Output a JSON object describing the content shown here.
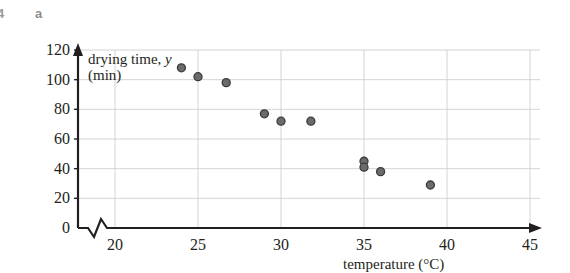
{
  "exercise": {
    "number": "4",
    "part_label": "a"
  },
  "chart_data": {
    "type": "scatter",
    "title": "",
    "xlabel": "temperature (°C)",
    "ylabel_line1": "drying time, ",
    "ylabel_symbol": "y",
    "ylabel_line2": "(min)",
    "xlim": [
      15,
      45
    ],
    "ylim": [
      0,
      120
    ],
    "xticks": [
      20,
      25,
      30,
      35,
      40,
      45
    ],
    "yticks": [
      0,
      20,
      40,
      60,
      80,
      100,
      120
    ],
    "xtick_labels": [
      "20",
      "25",
      "30",
      "35",
      "40",
      "45"
    ],
    "ytick_labels": [
      "0",
      "20",
      "40",
      "60",
      "80",
      "100",
      "120"
    ],
    "grid": true,
    "x_axis_break": true,
    "legend": "none",
    "marker_color": "#6b6b6b",
    "marker_edge_color": "#3a3a3a",
    "grid_color": "#c9c9c9",
    "axis_color": "#231f20",
    "points": [
      {
        "x": 24.0,
        "y": 108
      },
      {
        "x": 25.0,
        "y": 102
      },
      {
        "x": 26.7,
        "y": 98
      },
      {
        "x": 29.0,
        "y": 77
      },
      {
        "x": 30.0,
        "y": 72
      },
      {
        "x": 31.8,
        "y": 72
      },
      {
        "x": 35.0,
        "y": 45
      },
      {
        "x": 35.0,
        "y": 41
      },
      {
        "x": 36.0,
        "y": 38
      },
      {
        "x": 39.0,
        "y": 29
      }
    ]
  }
}
